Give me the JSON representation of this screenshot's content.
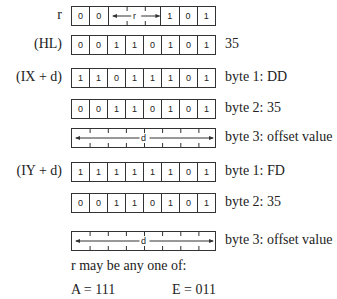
{
  "rows": [
    {
      "label": "r",
      "bits": [
        "0",
        "0"
      ],
      "span": {
        "label": "r",
        "cells": 3
      },
      "tail": [
        "1",
        "0",
        "1"
      ],
      "desc": ""
    },
    {
      "label": "(HL)",
      "bits": [
        "0",
        "0",
        "1",
        "1",
        "0",
        "1",
        "0",
        "1"
      ],
      "desc": "35"
    },
    {
      "label": "(IX + d)",
      "bits": [
        "1",
        "1",
        "0",
        "1",
        "1",
        "1",
        "0",
        "1"
      ],
      "desc": "byte 1: DD"
    },
    {
      "label": "",
      "bits": [
        "0",
        "0",
        "1",
        "1",
        "0",
        "1",
        "0",
        "1"
      ],
      "desc": "byte 2: 35"
    },
    {
      "label": "",
      "span": {
        "label": "d",
        "cells": 8
      },
      "desc": "byte 3: offset value"
    },
    {
      "label": "(IY + d)",
      "bits": [
        "1",
        "1",
        "1",
        "1",
        "1",
        "1",
        "0",
        "1"
      ],
      "desc": "byte 1: FD"
    },
    {
      "label": "",
      "bits": [
        "0",
        "0",
        "1",
        "1",
        "0",
        "1",
        "0",
        "1"
      ],
      "desc": "byte 2: 35"
    },
    {
      "label": "",
      "span": {
        "label": "d",
        "cells": 8
      },
      "desc": "byte 3: offset value"
    }
  ],
  "note": "r may be any one of:",
  "register_codes": [
    {
      "reg": "A",
      "code": "111"
    },
    {
      "reg": "E",
      "code": "011"
    }
  ]
}
